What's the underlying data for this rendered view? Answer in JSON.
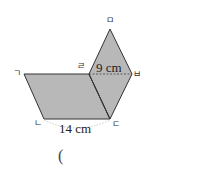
{
  "figure": {
    "fill_color": "#b8b8b8",
    "stroke_color": "#333333",
    "vertices": {
      "giyeok": {
        "label": "ㄱ",
        "x": 24,
        "y": 74
      },
      "nieun": {
        "label": "ㄴ",
        "x": 44,
        "y": 119
      },
      "digeut": {
        "label": "ㄷ",
        "x": 110,
        "y": 119
      },
      "rieul": {
        "label": "ㄹ",
        "x": 89,
        "y": 74
      },
      "mieum": {
        "label": "ㅁ",
        "x": 110,
        "y": 29
      },
      "bieup": {
        "label": "ㅂ",
        "x": 132,
        "y": 74
      }
    },
    "dimensions": {
      "top_segment": "9 cm",
      "bottom_segment": "14 cm"
    }
  },
  "answer": {
    "open_paren": "("
  }
}
